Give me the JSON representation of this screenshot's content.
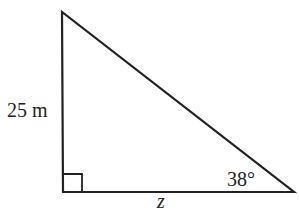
{
  "diagram": {
    "type": "right-triangle",
    "vertices": {
      "top": [
        62,
        12
      ],
      "right_angle": [
        63,
        192
      ],
      "bottom_right": [
        294,
        192
      ]
    },
    "labels": {
      "vertical_side": "25 m",
      "horizontal_side": "z",
      "angle": "38°"
    },
    "right_angle_marker": true,
    "stroke_color": "#222222"
  }
}
